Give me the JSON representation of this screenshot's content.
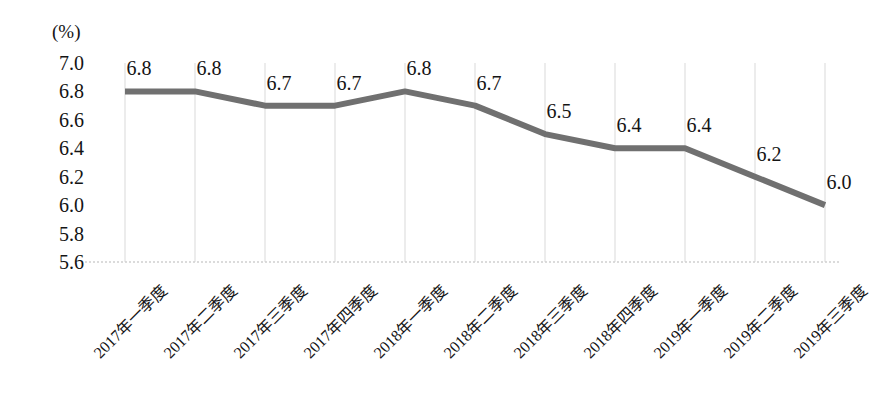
{
  "chart_data": {
    "type": "line",
    "title": "",
    "subtitle": "",
    "xlabel": "",
    "ylabel": "(%)",
    "unit_label": "(%)",
    "categories": [
      "2017年一季度",
      "2017年二季度",
      "2017年三季度",
      "2017年四季度",
      "2018年一季度",
      "2018年二季度",
      "2018年三季度",
      "2018年四季度",
      "2019年一季度",
      "2019年二季度",
      "2019年三季度"
    ],
    "values": [
      6.8,
      6.8,
      6.7,
      6.7,
      6.8,
      6.7,
      6.5,
      6.4,
      6.4,
      6.2,
      6.0
    ],
    "point_labels": [
      "6.8",
      "6.8",
      "6.7",
      "6.7",
      "6.8",
      "6.7",
      "6.5",
      "6.4",
      "6.4",
      "6.2",
      "6.0"
    ],
    "ylim": [
      5.6,
      7.0
    ],
    "ytick_step": 0.2,
    "ytick_labels": [
      "7.0",
      "6.8",
      "6.6",
      "6.4",
      "6.2",
      "6.0",
      "5.8",
      "5.6"
    ],
    "ytick_values": [
      7.0,
      6.8,
      6.6,
      6.4,
      6.2,
      6.0,
      5.8,
      5.6
    ],
    "grid": {
      "vertical": true,
      "horizontal": false,
      "baseline_dotted": true,
      "color": "#d9d9d9"
    },
    "legend": {
      "visible": false,
      "position": "none",
      "entries": []
    },
    "series_color": "#707070",
    "line_width": 6,
    "annotations": []
  },
  "colors": {
    "line": "#707070",
    "grid": "#d9d9d9",
    "baseline": "#d0d0d0",
    "text": "#141414",
    "background": "#ffffff"
  }
}
